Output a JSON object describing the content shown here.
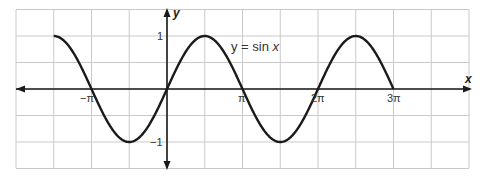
{
  "chart_data": {
    "type": "line",
    "title": "",
    "function": "y = sin x",
    "xlabel": "x",
    "ylabel": "y",
    "xlim_radians": [
      -4.398,
      9.425
    ],
    "ylim": [
      -1.5,
      1.5
    ],
    "grid": true,
    "legend": null,
    "annotation": {
      "text_prefix": "y = sin ",
      "text_var": "x"
    },
    "x_ticks": [
      {
        "value": -3.1416,
        "label": "−π"
      },
      {
        "value": 3.1416,
        "label": "π"
      },
      {
        "value": 6.2832,
        "label": "2π"
      },
      {
        "value": 9.4248,
        "label": "3π"
      }
    ],
    "y_ticks": [
      {
        "value": 1,
        "label": "1"
      },
      {
        "value": -1,
        "label": "−1"
      }
    ],
    "series": [
      {
        "name": "y = sin x",
        "x_range": [
          -4.712,
          9.425
        ],
        "points": [
          [
            -4.712,
            1
          ],
          [
            -3.1416,
            0
          ],
          [
            -1.5708,
            -1
          ],
          [
            0,
            0
          ],
          [
            1.5708,
            1
          ],
          [
            3.1416,
            0
          ],
          [
            4.7124,
            -1
          ],
          [
            6.2832,
            0
          ],
          [
            7.854,
            1
          ],
          [
            9.4248,
            0
          ],
          [
            10.996,
            -1
          ],
          [
            12.566,
            0
          ]
        ]
      }
    ]
  }
}
